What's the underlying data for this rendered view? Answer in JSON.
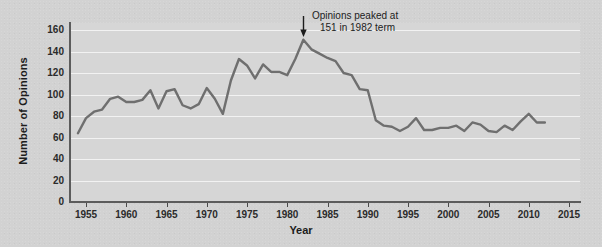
{
  "chart_data": {
    "type": "line",
    "title": "",
    "xlabel": "Year",
    "ylabel": "Number of Opinions",
    "xlim": [
      1953,
      2016
    ],
    "ylim": [
      0,
      170
    ],
    "grid": true,
    "legend": "none",
    "xticks": [
      1955,
      1960,
      1965,
      1970,
      1975,
      1980,
      1985,
      1990,
      1995,
      2000,
      2005,
      2010,
      2015
    ],
    "yticks": [
      0,
      20,
      40,
      60,
      80,
      100,
      120,
      140,
      160
    ],
    "line_color": "#6f6f6f",
    "annotations": [
      {
        "text_line1": "Opinions peaked at",
        "text_line2": "151 in 1982 term",
        "points_to_year": 1982,
        "points_to_value": 151,
        "arrow": "down-arrow-icon"
      }
    ],
    "x": [
      1954,
      1955,
      1956,
      1957,
      1958,
      1959,
      1960,
      1961,
      1962,
      1963,
      1964,
      1965,
      1966,
      1967,
      1968,
      1969,
      1970,
      1971,
      1972,
      1973,
      1974,
      1975,
      1976,
      1977,
      1978,
      1979,
      1980,
      1981,
      1982,
      1983,
      1984,
      1985,
      1986,
      1987,
      1988,
      1989,
      1990,
      1991,
      1992,
      1993,
      1994,
      1995,
      1996,
      1997,
      1998,
      1999,
      2000,
      2001,
      2002,
      2003,
      2004,
      2005,
      2006,
      2007,
      2008,
      2009,
      2010,
      2011,
      2012
    ],
    "y": [
      64,
      78,
      84,
      86,
      96,
      98,
      93,
      93,
      95,
      104,
      87,
      103,
      105,
      90,
      87,
      91,
      106,
      96,
      82,
      113,
      133,
      127,
      115,
      128,
      121,
      121,
      118,
      133,
      151,
      142,
      138,
      134,
      131,
      120,
      118,
      105,
      104,
      76,
      71,
      70,
      66,
      70,
      78,
      67,
      67,
      69,
      69,
      71,
      66,
      74,
      72,
      66,
      65,
      71,
      67,
      75,
      82,
      74,
      74
    ]
  },
  "axis": {
    "y_title": "Number of Opinions",
    "x_title": "Year"
  }
}
